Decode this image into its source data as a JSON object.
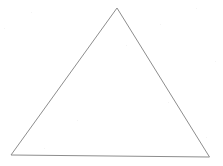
{
  "document": {
    "title": "Triangle Figure",
    "kind": "line-drawing",
    "background_color": "#ffffff",
    "width": 223,
    "height": 166
  },
  "figure": {
    "name": "triangle",
    "stroke_color": "#8d8d8d",
    "stroke_width": 1,
    "fill": "none",
    "closed": true,
    "vertices": [
      {
        "label": "apex",
        "x": 117,
        "y": 8
      },
      {
        "label": "bottom-right",
        "x": 209.5,
        "y": 157
      },
      {
        "label": "bottom-left",
        "x": 11,
        "y": 155
      }
    ],
    "points_attr": "117,8 209.5,157 11,155",
    "edges": [
      {
        "label": "left-side",
        "from": "apex",
        "to": "bottom-left"
      },
      {
        "label": "right-side",
        "from": "apex",
        "to": "bottom-right"
      },
      {
        "label": "base",
        "from": "bottom-left",
        "to": "bottom-right"
      }
    ]
  },
  "speckles": [
    {
      "x": 4,
      "y": 28
    },
    {
      "x": 31,
      "y": 12
    },
    {
      "x": 77,
      "y": 120
    },
    {
      "x": 126,
      "y": 45
    },
    {
      "x": 160,
      "y": 24
    },
    {
      "x": 168,
      "y": 102
    },
    {
      "x": 196,
      "y": 8
    },
    {
      "x": 215,
      "y": 61
    },
    {
      "x": 206,
      "y": 137
    },
    {
      "x": 44,
      "y": 148
    }
  ]
}
